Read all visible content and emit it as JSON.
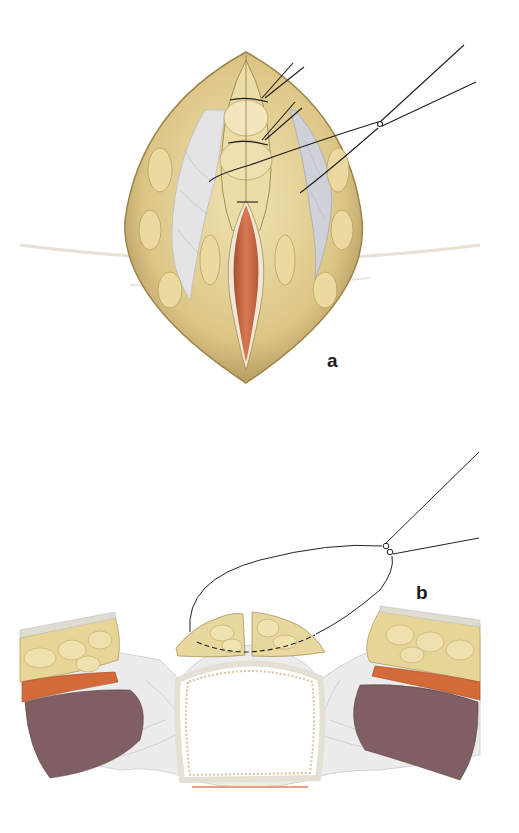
{
  "figure": {
    "panels": [
      {
        "id": "a",
        "label": "a",
        "description": "Superficial view of wound edges with sutures placed and knot tied"
      },
      {
        "id": "b",
        "label": "b",
        "description": "Cross-sectional view of suture through tissue layers with knot"
      }
    ]
  },
  "colors": {
    "fat": "#e6d49a",
    "fat_dark": "#b59d5c",
    "fat_light": "#f3e7bd",
    "fascia": "#d9dbe0",
    "muscle_red": "#d16a3b",
    "muscle_dark": "#7d5e62",
    "mucosa": "#c96a45",
    "suture": "#222222",
    "background": "#ffffff"
  }
}
